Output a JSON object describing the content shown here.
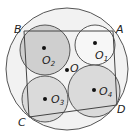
{
  "diagram": {
    "outer_circle": {
      "cx": 67,
      "cy": 69,
      "r": 61,
      "fill": "#f2f2f2"
    },
    "circles": [
      {
        "id": "O2",
        "cx": 45,
        "cy": 50,
        "r": 25,
        "fill": "#cfcfcf"
      },
      {
        "id": "O1",
        "cx": 95,
        "cy": 45,
        "r": 20,
        "fill": "#f4f4f4"
      },
      {
        "id": "O3",
        "cx": 45,
        "cy": 99,
        "r": 23,
        "fill": "#dadada"
      },
      {
        "id": "O4",
        "cx": 94,
        "cy": 91,
        "r": 26,
        "fill": "#dadada"
      }
    ],
    "quadrilateral": [
      [
        24,
        31
      ],
      [
        113,
        31
      ],
      [
        117,
        105
      ],
      [
        29,
        117
      ]
    ],
    "center": {
      "cx": 67,
      "cy": 70
    },
    "labels": {
      "A": "A",
      "B": "B",
      "C": "C",
      "D": "D",
      "O": "O",
      "O1_main": "O",
      "O1_sub": "1",
      "O2_main": "O",
      "O2_sub": "2",
      "O3_main": "O",
      "O3_sub": "3",
      "O4_main": "O",
      "O4_sub": "4"
    }
  }
}
